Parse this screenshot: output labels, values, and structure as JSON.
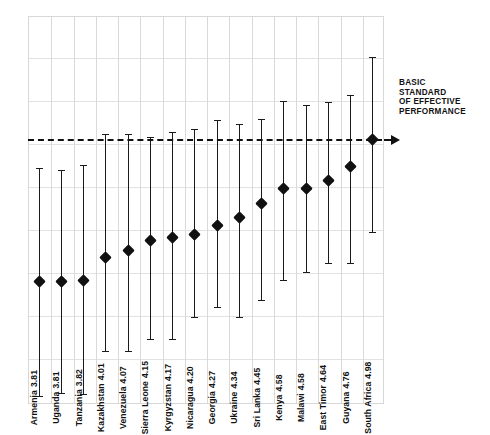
{
  "chart_data": {
    "type": "scatter",
    "title": "",
    "subtitle": "",
    "xlabel": "",
    "ylabel": "",
    "grid": true,
    "legend": "none",
    "ylim": [
      2.8,
      6.0
    ],
    "reference_line": {
      "value": 4.98,
      "style": "dashed",
      "label_lines": [
        "BASIC",
        "STANDARD",
        "OF EFFECTIVE",
        "PERFORMANCE"
      ],
      "arrow": true
    },
    "categories": [
      "Armenia",
      "Uganda",
      "Tanzania",
      "Kazakhstan",
      "Venezuela",
      "Sierra Leone",
      "Kyrgyzstan",
      "Nicaragua",
      "Georgia",
      "Ukraine",
      "Sri Lanka",
      "Kenya",
      "Malawi",
      "East Timor",
      "Guyana",
      "South Africa"
    ],
    "values": [
      3.81,
      3.81,
      3.82,
      4.01,
      4.07,
      4.15,
      4.17,
      4.2,
      4.27,
      4.34,
      4.45,
      4.58,
      4.58,
      4.64,
      4.76,
      4.98
    ],
    "value_labels": [
      "3.81",
      "3.81",
      "3.82",
      "4.01",
      "4.07",
      "4.15",
      "4.17",
      "4.20",
      "4.27",
      "4.34",
      "4.45",
      "4.58",
      "4.58",
      "4.64",
      "4.76",
      "4.98"
    ],
    "error_low": [
      2.87,
      2.89,
      2.88,
      3.24,
      3.24,
      3.34,
      3.34,
      3.52,
      3.6,
      3.52,
      3.66,
      3.82,
      3.89,
      3.96,
      3.96,
      4.22
    ],
    "error_high": [
      4.75,
      4.73,
      4.77,
      5.03,
      5.03,
      5.0,
      5.04,
      5.07,
      5.14,
      5.11,
      5.15,
      5.3,
      5.27,
      5.29,
      5.35,
      5.66
    ],
    "points": [
      {
        "category": "Armenia",
        "label": "Armenia",
        "value": 3.81,
        "value_label": "3.81",
        "low": 2.87,
        "high": 4.75
      },
      {
        "category": "Uganda",
        "label": "Uganda",
        "value": 3.81,
        "value_label": "3.81",
        "low": 2.89,
        "high": 4.73
      },
      {
        "category": "Tanzania",
        "label": "Tanzania",
        "value": 3.82,
        "value_label": "3.82",
        "low": 2.88,
        "high": 4.77
      },
      {
        "category": "Kazakhstan",
        "label": "Kazakhstan",
        "value": 4.01,
        "value_label": "4.01",
        "low": 3.24,
        "high": 5.03
      },
      {
        "category": "Venezuela",
        "label": "Venezuela",
        "value": 4.07,
        "value_label": "4.07",
        "low": 3.24,
        "high": 5.03
      },
      {
        "category": "Sierra Leone",
        "label": "Sierra Leone",
        "value": 4.15,
        "value_label": "4.15",
        "low": 3.34,
        "high": 5.0
      },
      {
        "category": "Kyrgyzstan",
        "label": "Kyrgyzstan",
        "value": 4.17,
        "value_label": "4.17",
        "low": 3.34,
        "high": 5.04
      },
      {
        "category": "Nicaragua",
        "label": "Nicaragua",
        "value": 4.2,
        "value_label": "4.20",
        "low": 3.52,
        "high": 5.07
      },
      {
        "category": "Georgia",
        "label": "Georgia",
        "value": 4.27,
        "value_label": "4.27",
        "low": 3.6,
        "high": 5.14
      },
      {
        "category": "Ukraine",
        "label": "Ukraine",
        "value": 4.34,
        "value_label": "4.34",
        "low": 3.52,
        "high": 5.11
      },
      {
        "category": "Sri Lanka",
        "label": "Sri Lanka",
        "value": 4.45,
        "value_label": "4.45",
        "low": 3.66,
        "high": 5.15
      },
      {
        "category": "Kenya",
        "label": "Kenya",
        "value": 4.58,
        "value_label": "4.58",
        "low": 3.82,
        "high": 5.3
      },
      {
        "category": "Malawi",
        "label": "Malawi",
        "value": 4.58,
        "value_label": "4.58",
        "low": 3.89,
        "high": 5.27
      },
      {
        "category": "East Timor",
        "label": "East Timor",
        "value": 4.64,
        "value_label": "4.64",
        "low": 3.96,
        "high": 5.29
      },
      {
        "category": "Guyana",
        "label": "Guyana",
        "value": 4.76,
        "value_label": "4.76",
        "low": 3.96,
        "high": 5.35
      },
      {
        "category": "South Africa",
        "label": "South Africa",
        "value": 4.98,
        "value_label": "4.98",
        "low": 4.22,
        "high": 5.66
      }
    ]
  },
  "annotation": {
    "lines": [
      "BASIC",
      "STANDARD",
      "OF EFFECTIVE",
      "PERFORMANCE"
    ]
  },
  "colors": {
    "marker": "#111111",
    "whisker": "#1a1a1a",
    "grid": "#e2e2e2",
    "frame": "#d8d8d8",
    "reference": "#111111",
    "background": "#ffffff"
  },
  "layout": {
    "plot_left": 28,
    "plot_top": 16,
    "plot_width": 356,
    "plot_height": 388,
    "n_columns": 16,
    "h_gridlines": [
      16,
      57,
      100,
      143,
      186,
      229,
      272,
      315,
      358
    ],
    "label_band_top": 300
  }
}
